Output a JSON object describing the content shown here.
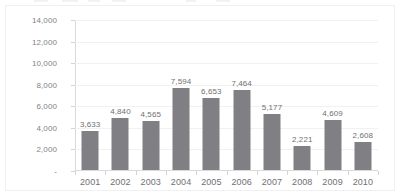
{
  "chart_data": {
    "type": "bar",
    "title": "",
    "subtitle": "",
    "xlabel": "",
    "ylabel": "",
    "categories": [
      "2001",
      "2002",
      "2003",
      "2004",
      "2005",
      "2006",
      "2007",
      "2008",
      "2009",
      "2010"
    ],
    "values": [
      3633,
      4840,
      4565,
      7594,
      6653,
      7464,
      5177,
      2221,
      4609,
      2608
    ],
    "data_labels": [
      "3,633",
      "4,840",
      "4,565",
      "7,594",
      "6,653",
      "7,464",
      "5,177",
      "2,221",
      "4,609",
      "2,608"
    ],
    "ylim": [
      0,
      14000
    ],
    "ytick_values": [
      0,
      2000,
      4000,
      6000,
      8000,
      10000,
      12000,
      14000
    ],
    "ytick_labels": [
      "-",
      "2,000",
      "4,000",
      "6,000",
      "8,000",
      "10,000",
      "12,000",
      "14,000"
    ],
    "grid": true,
    "grid_axis": "y",
    "legend": "none",
    "series": [
      {
        "name": "",
        "values": [
          3633,
          4840,
          4565,
          7594,
          6653,
          7464,
          5177,
          2221,
          4609,
          2608
        ]
      }
    ]
  },
  "style": {
    "bar_color": "#808084",
    "grid_color": "#f1f1f2",
    "axis_color": "#d9d9dc",
    "label_color": "#6f6f74",
    "tick_label_color": "#828287",
    "background": "#ffffff",
    "frame_border": "#f0f0f1"
  }
}
